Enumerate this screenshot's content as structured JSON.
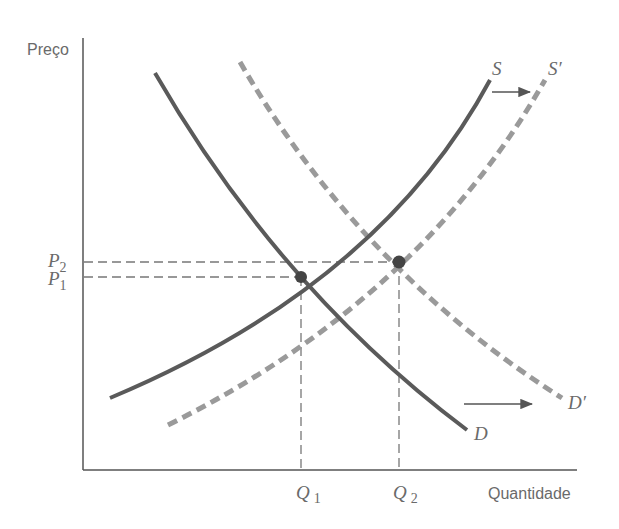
{
  "diagram": {
    "type": "supply-demand-shift",
    "axes": {
      "y_label": "Preço",
      "x_label": "Quantidade"
    },
    "price_ticks": [
      {
        "base": "P",
        "sub": "2"
      },
      {
        "base": "P",
        "sub": "1"
      }
    ],
    "quantity_ticks": [
      {
        "base": "Q",
        "sub": "1"
      },
      {
        "base": "Q",
        "sub": "2"
      }
    ],
    "curves": {
      "supply": {
        "label": "S",
        "style": "solid"
      },
      "supply_shifted": {
        "label": "S′",
        "style": "dashed"
      },
      "demand": {
        "label": "D",
        "style": "solid"
      },
      "demand_shifted": {
        "label": "D′",
        "style": "dashed"
      }
    },
    "equilibria": [
      {
        "name": "E1",
        "price": "P1",
        "quantity": "Q1"
      },
      {
        "name": "E2",
        "price": "P2",
        "quantity": "Q2"
      }
    ],
    "shift_arrows": [
      {
        "from": "S",
        "to": "S′",
        "direction": "right"
      },
      {
        "from": "D",
        "to": "D′",
        "direction": "right"
      }
    ],
    "colors": {
      "curve": "#5a5a5a",
      "shifted_curve": "#9a9a9a",
      "axis": "#555555",
      "guide": "#777777",
      "text": "#6a6a6a"
    }
  }
}
